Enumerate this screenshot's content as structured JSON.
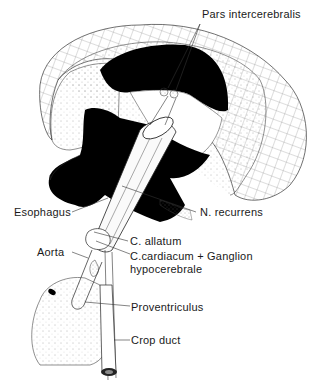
{
  "figure": {
    "type": "anatomical illustration",
    "colors": {
      "ink": "#1a1a1a",
      "background": "#ffffff",
      "fill_black": "#000000",
      "stipple": "#555555"
    },
    "labels": [
      {
        "id": "pars-intercerebralis",
        "text": "Pars intercerebralis"
      },
      {
        "id": "esophagus",
        "text": "Esophagus"
      },
      {
        "id": "n-recurrens",
        "text": "N. recurrens"
      },
      {
        "id": "c-allatum",
        "text": "C. allatum"
      },
      {
        "id": "aorta",
        "text": "Aorta"
      },
      {
        "id": "c-cardiacum",
        "text": "C.cardiacum + Ganglion"
      },
      {
        "id": "hypocerebrale",
        "text": "hypocerebrale"
      },
      {
        "id": "proventriculus",
        "text": "Proventriculus"
      },
      {
        "id": "crop-duct",
        "text": "Crop duct"
      }
    ]
  }
}
